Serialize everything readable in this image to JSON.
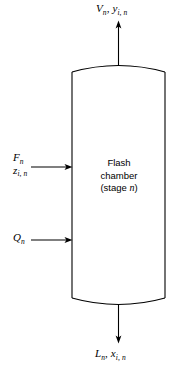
{
  "diagram": {
    "type": "process-flow-diagram",
    "colors": {
      "stroke": "#000000",
      "background": "#ffffff"
    },
    "vessel": {
      "body_line1": "Flash",
      "body_line2": "chamber",
      "body_line3_prefix": "(stage ",
      "body_line3_var": "n",
      "body_line3_suffix": ")"
    },
    "streams": {
      "vapor_out": {
        "name": "vapor-product-stream",
        "direction": "up",
        "var_flow": "V",
        "var_flow_sub": "n",
        "separator": ", ",
        "var_comp": "y",
        "var_comp_sub": "i, n"
      },
      "liquid_out": {
        "name": "liquid-product-stream",
        "direction": "down",
        "var_flow": "L",
        "var_flow_sub": "n",
        "separator": ", ",
        "var_comp": "x",
        "var_comp_sub": "i, n"
      },
      "feed_in": {
        "name": "feed-stream",
        "direction": "right",
        "var_flow": "F",
        "var_flow_sub": "n",
        "var_comp": "z",
        "var_comp_sub": "i, n"
      },
      "heat_in": {
        "name": "heat-duty-stream",
        "direction": "right",
        "var_flow": "Q",
        "var_flow_sub": "n"
      }
    }
  }
}
